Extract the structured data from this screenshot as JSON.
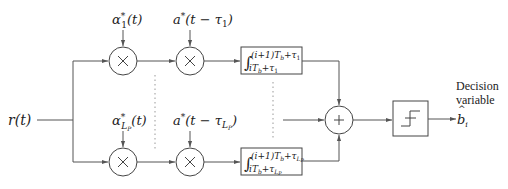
{
  "diagram": {
    "input": {
      "label": "r(t)"
    },
    "top_branch": {
      "mult1_input": {
        "base": "α",
        "sup": "*",
        "sub": "1",
        "arg": "(t)"
      },
      "mult2_input": {
        "base": "a",
        "sup": "*",
        "arg_pre": "(t − τ",
        "sub": "1",
        "arg_post": ")"
      },
      "integrator": {
        "symbol": "∫",
        "upper": "(i+1)T",
        "upper_sub": "b",
        "upper_tail": "+τ",
        "upper_tail_sub": "1",
        "lower": "iT",
        "lower_sub": "b",
        "lower_tail": "+τ",
        "lower_tail_sub": "1"
      },
      "multiplier_symbol": "×"
    },
    "bottom_branch": {
      "mult1_input": {
        "base": "α",
        "sup": "*",
        "sub": "L",
        "subsub": "P",
        "arg": "(t)"
      },
      "mult2_input": {
        "base": "a",
        "sup": "*",
        "arg_pre": "(t − τ",
        "sub": "L",
        "subsub": "P",
        "arg_post": ")"
      },
      "integrator": {
        "symbol": "∫",
        "upper": "(i+1)T",
        "upper_sub": "b",
        "upper_tail": "+τ",
        "upper_tail_sub": "L",
        "upper_tail_subsub": "P",
        "lower": "iT",
        "lower_sub": "b",
        "lower_tail": "+τ",
        "lower_tail_sub": "L",
        "lower_tail_subsub": "P"
      },
      "multiplier_symbol": "×"
    },
    "summer": {
      "symbol": "+"
    },
    "decision": {
      "shape": "hard-limiter-step"
    },
    "output": {
      "label_line1": "Decision",
      "label_line2": "variable",
      "symbol": "b",
      "hat": "^",
      "sub": "i"
    }
  }
}
